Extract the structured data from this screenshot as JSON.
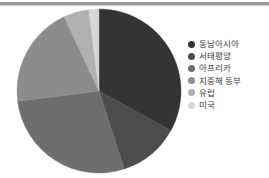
{
  "chart_data": {
    "type": "pie",
    "title": "",
    "legend_position": "right",
    "categories": [
      "동남아시아",
      "서태평양",
      "아프리카",
      "지중해 동부",
      "유럽",
      "미국"
    ],
    "values": [
      33,
      12,
      28,
      20,
      5,
      2
    ],
    "units": "percent",
    "colors": [
      "#343434",
      "#4d4d4d",
      "#6e6e6e",
      "#8c8c8c",
      "#b0b0b0",
      "#d6d6d6"
    ],
    "start_angle_deg": 0,
    "direction": "clockwise",
    "labels_shown": false,
    "grid": false
  },
  "legend": {
    "items": [
      {
        "label": "동남아시아",
        "color": "#343434",
        "dot": "legend-dot-icon"
      },
      {
        "label": "서태평양",
        "color": "#4d4d4d",
        "dot": "legend-dot-icon"
      },
      {
        "label": "아프리카",
        "color": "#6e6e6e",
        "dot": "legend-dot-icon"
      },
      {
        "label": "지중해 동부",
        "color": "#8c8c8c",
        "dot": "legend-dot-icon"
      },
      {
        "label": "유럽",
        "color": "#b0b0b0",
        "dot": "legend-dot-icon"
      },
      {
        "label": "미국",
        "color": "#d6d6d6",
        "dot": "legend-dot-icon"
      }
    ]
  },
  "pie": {
    "center_x": 99,
    "center_y": 85,
    "radius": 82
  }
}
